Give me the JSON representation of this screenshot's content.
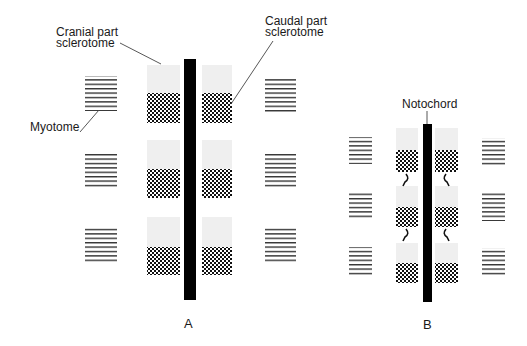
{
  "colors": {
    "background": "#ffffff",
    "notochord": "#000000",
    "cranial_sclerotome": "#eeeeee",
    "caudal_sclerotome_dot": "#111111",
    "myotome_line": "#333333",
    "leader_line": "#444444",
    "text": "#1a1a1a"
  },
  "labels": {
    "cranial_line1": "Cranial part",
    "cranial_line2": "sclerotome",
    "caudal_line1": "Caudal part",
    "caudal_line2": "sclerotome",
    "myotome": "Myotome",
    "notochord": "Notochord",
    "panel_a": "A",
    "panel_b": "B"
  },
  "panels": [
    {
      "id": "A",
      "segments": 3,
      "description": "Normal: notochord flanked by cranial (light) and caudal (dense checkered) sclerotome halves, myotomes lateral"
    },
    {
      "id": "B",
      "segments": 3,
      "description": "Compressed: caudal sclerotome halves with arrows indicating resegmentation toward cranial halves"
    }
  ]
}
